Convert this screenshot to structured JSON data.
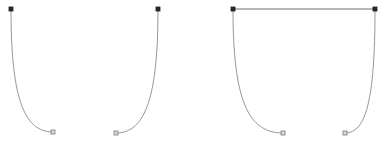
{
  "canvas": {
    "width": 388,
    "height": 143,
    "background_color": "#ffffff"
  },
  "style": {
    "curve_stroke_color": "#8a8a8a",
    "curve_stroke_width": 0.9,
    "bar_stroke_color": "#6f6f6f",
    "bar_stroke_width": 1.0,
    "anchor_fill_color": "#2b2b2b",
    "anchor_stroke_color": "#1a1a1a",
    "endpoint_fill_color": "#d9d9d9",
    "endpoint_stroke_color": "#7a7a7a",
    "marker_size": 4
  },
  "chart_data": {
    "type": "line",
    "title": "",
    "subtitle": "",
    "xlabel": "",
    "ylabel": "",
    "grid": false,
    "legend": "none",
    "xlim": [
      0,
      388
    ],
    "ylim": [
      0,
      143
    ],
    "series": [
      {
        "name": "curve-1",
        "group": "figure-1",
        "anchor": [
          11,
          9
        ],
        "free_end": [
          53,
          132
        ],
        "control_points": [
          [
            11,
            95
          ],
          [
            23,
            132
          ]
        ],
        "path": "M 11 9 C 11 95 23 132 53 132",
        "direction": "opens-right"
      },
      {
        "name": "curve-2",
        "group": "figure-2",
        "anchor": [
          158,
          9
        ],
        "free_end": [
          116,
          133
        ],
        "control_points": [
          [
            158,
            95
          ],
          [
            146,
            133
          ]
        ],
        "path": "M 158 9 C 158 95 146 133 116 133",
        "direction": "opens-left"
      },
      {
        "name": "curve-3",
        "group": "figure-3",
        "anchor": [
          233,
          9
        ],
        "free_end": [
          283,
          133
        ],
        "control_points": [
          [
            233,
            100
          ],
          [
            248,
            133
          ]
        ],
        "path": "M 233 9 C 233 100 248 133 283 133",
        "direction": "opens-right"
      },
      {
        "name": "curve-4",
        "group": "figure-3",
        "anchor": [
          375,
          9
        ],
        "free_end": [
          345,
          133
        ],
        "control_points": [
          [
            375,
            100
          ],
          [
            366,
            133
          ]
        ],
        "path": "M 375 9 C 375 100 366 133 345 133",
        "direction": "opens-left"
      }
    ],
    "connectors": [
      {
        "name": "top-bar",
        "group": "figure-3",
        "from": [
          233,
          9
        ],
        "to": [
          375,
          9
        ],
        "path": "M 233 9 L 375 9",
        "length": 142
      }
    ],
    "anchor_points": [
      {
        "name": "anchor-1",
        "x": 11,
        "y": 9
      },
      {
        "name": "anchor-2",
        "x": 158,
        "y": 9
      },
      {
        "name": "anchor-3",
        "x": 233,
        "y": 9
      },
      {
        "name": "anchor-4",
        "x": 375,
        "y": 9
      }
    ],
    "free_end_points": [
      {
        "name": "free-end-1",
        "x": 53,
        "y": 132
      },
      {
        "name": "free-end-2",
        "x": 116,
        "y": 133
      },
      {
        "name": "free-end-3",
        "x": 283,
        "y": 133
      },
      {
        "name": "free-end-4",
        "x": 345,
        "y": 133
      }
    ]
  }
}
